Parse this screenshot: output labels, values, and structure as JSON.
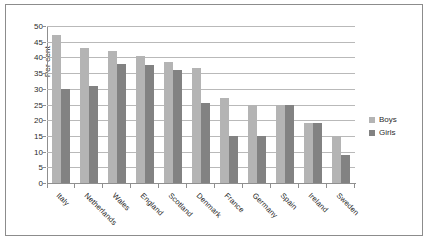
{
  "chart_data": {
    "type": "bar",
    "title": "",
    "xlabel": "",
    "ylabel": "Per cent",
    "ylim": [
      0,
      50
    ],
    "ytick_step": 5,
    "yticks": [
      50,
      45,
      40,
      35,
      30,
      25,
      20,
      15,
      10,
      5,
      0
    ],
    "grid": true,
    "legend_position": "right",
    "categories": [
      "Italy",
      "Netherlands",
      "Wales",
      "England",
      "Scotland",
      "Denmark",
      "France",
      "Germany",
      "Spain",
      "Ireland",
      "Sweden"
    ],
    "series": [
      {
        "name": "Boys",
        "color": "#b4b4b4",
        "values": [
          47,
          43,
          42,
          40.5,
          38.5,
          36.5,
          27,
          25,
          25,
          19,
          15
        ]
      },
      {
        "name": "Girls",
        "color": "#828282",
        "values": [
          30,
          31,
          38,
          37.5,
          36,
          25.5,
          15,
          15,
          25,
          19,
          9
        ]
      }
    ]
  },
  "frame": {
    "border_color": "#8c8c8c",
    "background": "#ffffff"
  }
}
